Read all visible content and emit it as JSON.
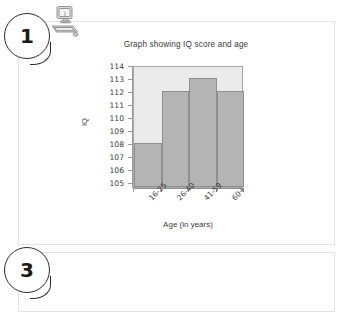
{
  "annotations": {
    "bubbles": [
      {
        "label": "1",
        "name": "callout-bubble-1"
      },
      {
        "label": "3",
        "name": "callout-bubble-3"
      }
    ],
    "clipart": "computer-clipart"
  },
  "chart_data": {
    "type": "bar",
    "title": "Graph showing IQ score and age",
    "xlabel": "Age (in years)",
    "ylabel": "IQ",
    "categories": [
      "16-25",
      "26-40",
      "41-59",
      "60+"
    ],
    "values": [
      108,
      112,
      113,
      112
    ],
    "ylim": [
      104.6,
      114
    ],
    "yticks": [
      105,
      106,
      107,
      108,
      109,
      110,
      111,
      112,
      113,
      114
    ],
    "grid": false,
    "legend": "none",
    "colors": {
      "bar_fill": "#b4b4b4",
      "bar_stroke": "#8f8f8f",
      "plot_background": "#ebebeb",
      "axis": "#9a9a9a",
      "text": "#3c3c3c"
    }
  }
}
